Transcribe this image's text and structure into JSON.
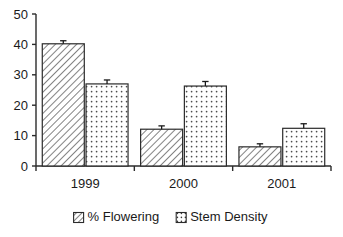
{
  "chart_data": {
    "type": "bar",
    "title": "",
    "subtitle": "",
    "xlabel": "",
    "ylabel": "",
    "categories": [
      "1999",
      "2000",
      "2001"
    ],
    "ylim": [
      0,
      50
    ],
    "yticks": [
      0,
      10,
      20,
      30,
      40,
      50
    ],
    "ytick_labels": [
      "0",
      "10",
      "20",
      "30",
      "40",
      "50"
    ],
    "grid": false,
    "legend_position": "bottom",
    "series": [
      {
        "name": "% Flowering",
        "fill": "diagonal-hatch",
        "values": [
          40.2,
          12.1,
          6.3
        ],
        "errors": [
          1.0,
          1.1,
          1.0
        ]
      },
      {
        "name": "Stem Density",
        "fill": "dotted",
        "values": [
          27.0,
          26.3,
          12.4
        ],
        "errors": [
          1.3,
          1.5,
          1.5
        ]
      }
    ],
    "annotations": [],
    "colors": {
      "axis": "#2b2b2b",
      "text": "#1a1a1a",
      "bar_outline": "#2b2b2b",
      "bar_fill": "#ffffff",
      "pattern": "#555555",
      "background": "#ffffff"
    }
  },
  "legend": {
    "items": [
      {
        "label": "% Flowering",
        "swatch": "hatch-swatch-icon"
      },
      {
        "label": "Stem Density",
        "swatch": "dot-swatch-icon"
      }
    ]
  }
}
